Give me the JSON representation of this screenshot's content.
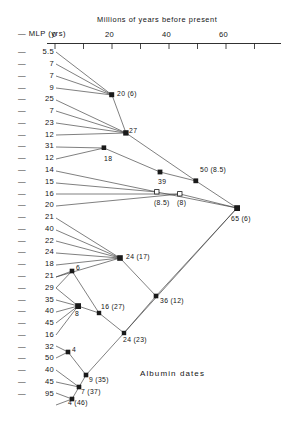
{
  "figure": {
    "caption": "Albumin dates",
    "mlp_header": "— MLP (yrs)",
    "axis_title": "Millions of years before present",
    "axis": {
      "ticks_labeled": [
        "0",
        "20",
        "40",
        "60"
      ],
      "tick_values": [
        0,
        20,
        40,
        60
      ],
      "minor_tick_values": [
        10,
        30,
        50,
        70
      ],
      "range": [
        0,
        76
      ],
      "units": "millions of years before present",
      "direction": "increasing to the right"
    },
    "mlp_column": {
      "label": "— MLP (yrs)",
      "dash": "—",
      "values": [
        "5.5",
        "7",
        "7",
        "9",
        "25",
        "7",
        "23",
        "12",
        "31",
        "12",
        "14",
        "15",
        "16",
        "20",
        "21",
        "40",
        "22",
        "24",
        "18",
        "21",
        "29",
        "35",
        "40",
        "45",
        "16",
        "32",
        "50",
        "40",
        "45",
        "95"
      ]
    },
    "node_labels": [
      {
        "id": "n-20-6",
        "text": "20 (6)",
        "date": 20,
        "sd": 6
      },
      {
        "id": "n-27",
        "text": "27",
        "date": 27,
        "sd": null
      },
      {
        "id": "n-18",
        "text": "18",
        "date": 18,
        "sd": null
      },
      {
        "id": "n-50-85",
        "text": "50 (8.5)",
        "date": 50,
        "sd": 8.5
      },
      {
        "id": "n-39",
        "text": "39",
        "date": 39,
        "sd": null
      },
      {
        "id": "n-85",
        "text": "(8.5)",
        "date": null,
        "sd": 8.5
      },
      {
        "id": "n-8",
        "text": "(8)",
        "date": null,
        "sd": 8
      },
      {
        "id": "n-65-6",
        "text": "65 (6)",
        "date": 65,
        "sd": 6
      },
      {
        "id": "n-24-17",
        "text": "24 (17)",
        "date": 24,
        "sd": 17
      },
      {
        "id": "n-6",
        "text": "6",
        "date": 6,
        "sd": null
      },
      {
        "id": "n-8b",
        "text": "8",
        "date": 8,
        "sd": null
      },
      {
        "id": "n-16-27",
        "text": "16 (27)",
        "date": 16,
        "sd": 27
      },
      {
        "id": "n-36-12",
        "text": "36 (12)",
        "date": 36,
        "sd": 12
      },
      {
        "id": "n-24-23",
        "text": "24 (23)",
        "date": 24,
        "sd": 23
      },
      {
        "id": "n-4",
        "text": "4",
        "date": 4,
        "sd": null
      },
      {
        "id": "n-9-35",
        "text": "9 (35)",
        "date": 9,
        "sd": 35
      },
      {
        "id": "n-7-37",
        "text": "7 (37)",
        "date": 7,
        "sd": 37
      },
      {
        "id": "n-4-46",
        "text": "4 (46)",
        "date": 4,
        "sd": 46
      }
    ],
    "chart_data": {
      "type": "scatter",
      "title": "Albumin dates",
      "xlabel": "Millions of years before present",
      "ylabel": "— MLP (yrs)",
      "xlim": [
        0,
        76
      ],
      "xticks": [
        0,
        20,
        40,
        60
      ],
      "grid": false,
      "legend": "none"
    }
  }
}
